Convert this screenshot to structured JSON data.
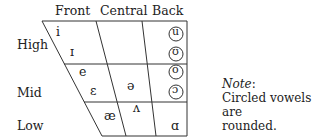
{
  "columns": [
    "Front",
    "Central",
    "Back"
  ],
  "rows": [
    "High",
    "Mid",
    "Low"
  ],
  "vowels": {
    "i": "i",
    "ih": "ɪ",
    "e": "e",
    "eh": "ɛ",
    "ae": "æ",
    "schwa": "ə",
    "wedge": "ʌ",
    "u": "u",
    "uh": "ʊ",
    "o": "o",
    "oh": "ɔ",
    "a": "ɑ"
  },
  "note": {
    "label": "Note",
    "colon": ":",
    "text_line1": "Circled vowels are",
    "text_line2": "rounded."
  }
}
